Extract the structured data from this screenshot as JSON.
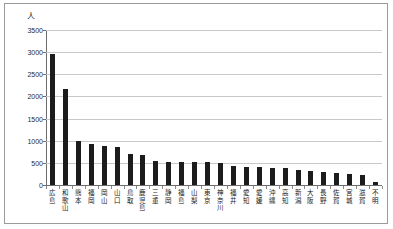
{
  "unit_label": "人",
  "colors": {
    "bar": "#1c1c1c",
    "grid": "#c9c9c9",
    "axis": "#6e6e6e",
    "frame": "#9a9a9a",
    "background": "#ffffff"
  },
  "chart_data": {
    "type": "bar",
    "title": "",
    "subtitle": "",
    "xlabel": "",
    "ylabel": "人",
    "ylim": [
      0,
      3500
    ],
    "ytick_labels": [
      "3500",
      "3000",
      "2500",
      "2000",
      "1500",
      "1000",
      "500",
      "0"
    ],
    "ytick_values": [
      3500,
      3000,
      2500,
      2000,
      1500,
      1000,
      500,
      0
    ],
    "ytick_interval": 500,
    "grid": true,
    "grid_axis": "y",
    "legend": false,
    "legend_position": "none",
    "categories": [
      "広島",
      "和歌山",
      "熊本",
      "福岡",
      "岡山",
      "山口",
      "鳥取",
      "鹿児島",
      "三重",
      "静岡",
      "福島",
      "山梨",
      "東京",
      "神奈川",
      "福井",
      "愛知",
      "愛媛",
      "沖縄",
      "高知",
      "新潟",
      "大阪",
      "長野",
      "佐賀",
      "宮城",
      "滋賀",
      "不明"
    ],
    "values": [
      2950,
      2170,
      1000,
      930,
      870,
      860,
      710,
      670,
      540,
      530,
      520,
      520,
      510,
      500,
      420,
      410,
      400,
      390,
      380,
      330,
      320,
      300,
      280,
      250,
      230,
      60
    ]
  }
}
